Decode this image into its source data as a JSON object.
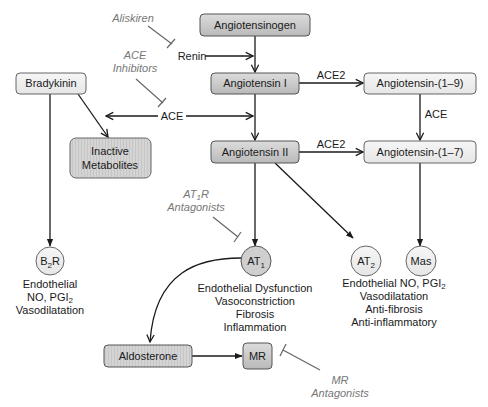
{
  "colors": {
    "dark_box_fill_top": "#d8d8d8",
    "dark_box_fill_bottom": "#b8b8b8",
    "light_box_fill": "#efefef",
    "circle_fill_dark": "#cfcfcf",
    "circle_fill_light": "#ececec",
    "stroke": "#555555",
    "drug_text": "#777777",
    "text": "#1a1a1a"
  },
  "nodes": {
    "angiotensinogen": "Angiotensinogen",
    "renin": "Renin",
    "angiotensin_i": "Angiotensin I",
    "angiotensin_ii": "Angiotensin II",
    "angiotensin_1_9": "Angiotensin-(1–9)",
    "angiotensin_1_7": "Angiotensin-(1–7)",
    "bradykinin": "Bradykinin",
    "inactive_metabolites_line1": "Inactive",
    "inactive_metabolites_line2": "Metabolites",
    "ace": "ACE",
    "aldosterone": "Aldosterone",
    "mr": "MR"
  },
  "receptors": {
    "b2r": {
      "base": "B",
      "sub": "2",
      "tail": "R"
    },
    "at1": {
      "base": "AT",
      "sub": "1"
    },
    "at2": {
      "base": "AT",
      "sub": "2"
    },
    "mas": {
      "base": "Mas"
    }
  },
  "edge_labels": {
    "ace2_top": "ACE2",
    "ace2_bottom": "ACE2",
    "ace_right": "ACE"
  },
  "drugs": {
    "aliskiren": "Aliskiren",
    "ace_inhibitors_line1": "ACE",
    "ace_inhibitors_line2": "Inhibitors",
    "at1r_antagonists_line1_base": "AT",
    "at1r_antagonists_line1_sub": "1",
    "at1r_antagonists_line1_tail": "R",
    "at1r_antagonists_line2": "Antagonists",
    "mr_antagonists_line1": "MR",
    "mr_antagonists_line2": "Antagonists"
  },
  "effects": {
    "b2r": {
      "line1": "Endothelial",
      "line2_base": "NO, PGI",
      "line2_sub": "2",
      "line3": "Vasodilatation"
    },
    "at1": [
      "Endothelial Dysfunction",
      "Vasoconstriction",
      "Fibrosis",
      "Inflammation"
    ],
    "at2_mas": {
      "line1_base": "Endothelial NO, PGI",
      "line1_sub": "2",
      "line2": "Vasodilatation",
      "line3": "Anti-fibrosis",
      "line4": "Anti-inflammatory"
    }
  }
}
